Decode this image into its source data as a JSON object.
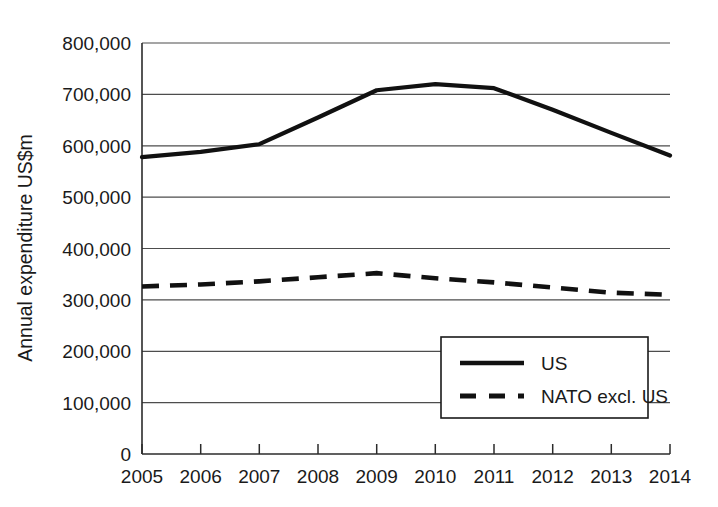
{
  "chart_data": {
    "type": "line",
    "title": "",
    "subtitle": "",
    "xlabel": "",
    "ylabel": "Annual expenditure US$m",
    "x": [
      2005,
      2006,
      2007,
      2008,
      2009,
      2010,
      2011,
      2012,
      2013,
      2014
    ],
    "categories": [
      "2005",
      "2006",
      "2007",
      "2008",
      "2009",
      "2010",
      "2011",
      "2012",
      "2013",
      "2014"
    ],
    "xtick_labels": [
      "2005",
      "2006",
      "2007",
      "2008",
      "2009",
      "2010",
      "2011",
      "2012",
      "2013",
      "2014"
    ],
    "ytick_labels": [
      "0",
      "100,000",
      "200,000",
      "300,000",
      "400,000",
      "500,000",
      "600,000",
      "700,000",
      "800,000"
    ],
    "ytick_values": [
      0,
      100000,
      200000,
      300000,
      400000,
      500000,
      600000,
      700000,
      800000
    ],
    "ylim": [
      0,
      800000
    ],
    "xlim": [
      2005,
      2014
    ],
    "grid": true,
    "grid_axis": "y",
    "legend_position": "lower-right-inside",
    "series": [
      {
        "name": "US",
        "style": "solid",
        "color": "#111111",
        "values": [
          578000,
          588000,
          603000,
          655000,
          708000,
          720000,
          712000,
          670000,
          625000,
          581000
        ]
      },
      {
        "name": "NATO excl. US",
        "style": "dashed",
        "color": "#111111",
        "values": [
          326000,
          330000,
          336000,
          344000,
          352000,
          342000,
          334000,
          324000,
          314000,
          310000
        ]
      }
    ]
  },
  "legend": {
    "items": [
      {
        "label": "US",
        "style": "solid"
      },
      {
        "label": "NATO excl. US",
        "style": "dashed"
      }
    ]
  },
  "axis": {
    "y_title": "Annual expenditure US$m"
  }
}
